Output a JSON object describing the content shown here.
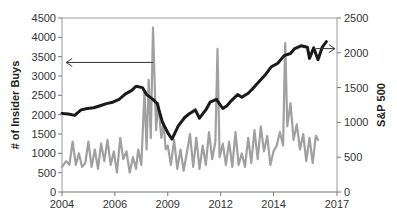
{
  "chart_data": {
    "type": "line",
    "title": "",
    "xlabel": "",
    "ylabel": "# of Insider Buys",
    "y2label": "S&P 500",
    "xlim": [
      2004,
      2017
    ],
    "ylim": [
      0,
      4500
    ],
    "y2lim": [
      0,
      2500
    ],
    "grid": false,
    "legend": "none",
    "x_ticks": [
      "2004",
      "2006",
      "2009",
      "2012",
      "2014",
      "2017"
    ],
    "x_tick_values": [
      2004,
      2006.5,
      2009,
      2011.5,
      2014,
      2016.5
    ],
    "y_ticks": [
      "0",
      "500",
      "1000",
      "1500",
      "2000",
      "2500",
      "3000",
      "3500",
      "4000",
      "4500"
    ],
    "y2_ticks": [
      "0",
      "500",
      "1000",
      "1500",
      "2000",
      "2500"
    ],
    "series": [
      {
        "name": "# of Insider Buys",
        "axis": "left",
        "color": "#a0a0a0",
        "x": [
          2004.0,
          2004.2,
          2004.35,
          2004.5,
          2004.65,
          2004.8,
          2004.95,
          2005.1,
          2005.25,
          2005.4,
          2005.55,
          2005.7,
          2005.85,
          2006.0,
          2006.15,
          2006.3,
          2006.45,
          2006.6,
          2006.75,
          2006.9,
          2007.05,
          2007.2,
          2007.35,
          2007.5,
          2007.6,
          2007.75,
          2007.9,
          2008.0,
          2008.1,
          2008.2,
          2008.3,
          2008.45,
          2008.55,
          2008.7,
          2008.8,
          2008.9,
          2009.0,
          2009.15,
          2009.3,
          2009.45,
          2009.6,
          2009.75,
          2009.9,
          2010.05,
          2010.2,
          2010.35,
          2010.5,
          2010.65,
          2010.8,
          2010.95,
          2011.1,
          2011.25,
          2011.35,
          2011.45,
          2011.6,
          2011.75,
          2011.9,
          2012.05,
          2012.2,
          2012.35,
          2012.5,
          2012.65,
          2012.8,
          2012.95,
          2013.1,
          2013.25,
          2013.4,
          2013.55,
          2013.7,
          2013.85,
          2014.0,
          2014.15,
          2014.3,
          2014.45,
          2014.55,
          2014.65,
          2014.8,
          2014.95,
          2015.1,
          2015.25,
          2015.4,
          2015.55,
          2015.7,
          2015.85,
          2016.0,
          2016.1
        ],
        "values": [
          650,
          800,
          700,
          1300,
          700,
          1000,
          650,
          750,
          1300,
          650,
          1100,
          600,
          1250,
          800,
          1350,
          700,
          1050,
          500,
          1400,
          850,
          1050,
          500,
          900,
          600,
          1100,
          700,
          2600,
          1100,
          2900,
          1400,
          4250,
          1600,
          2300,
          1400,
          1800,
          1100,
          1200,
          700,
          1350,
          600,
          1100,
          550,
          1000,
          1500,
          650,
          1400,
          600,
          1200,
          700,
          1550,
          850,
          1300,
          3700,
          900,
          1250,
          700,
          1300,
          650,
          1550,
          700,
          1000,
          650,
          1400,
          750,
          1600,
          850,
          1700,
          1050,
          1450,
          700,
          1050,
          1200,
          1550,
          1200,
          3850,
          1700,
          2300,
          1350,
          1750,
          1100,
          1500,
          800,
          1400,
          750,
          1450,
          1350
        ]
      },
      {
        "name": "S&P 500",
        "axis": "right",
        "color": "#1a1a1a",
        "x": [
          2004.0,
          2004.3,
          2004.6,
          2004.9,
          2005.2,
          2005.5,
          2005.8,
          2006.1,
          2006.4,
          2006.7,
          2007.0,
          2007.3,
          2007.5,
          2007.8,
          2008.0,
          2008.3,
          2008.5,
          2008.75,
          2009.0,
          2009.2,
          2009.5,
          2009.8,
          2010.0,
          2010.3,
          2010.5,
          2010.8,
          2011.0,
          2011.3,
          2011.6,
          2011.8,
          2012.0,
          2012.3,
          2012.5,
          2012.8,
          2013.0,
          2013.3,
          2013.6,
          2013.9,
          2014.2,
          2014.5,
          2014.8,
          2015.0,
          2015.3,
          2015.6,
          2015.7,
          2015.9,
          2016.1,
          2016.3,
          2016.5
        ],
        "values": [
          1130,
          1120,
          1100,
          1180,
          1200,
          1210,
          1240,
          1270,
          1290,
          1330,
          1410,
          1460,
          1520,
          1500,
          1400,
          1330,
          1270,
          1000,
          850,
          760,
          950,
          1070,
          1120,
          1180,
          1060,
          1180,
          1290,
          1330,
          1200,
          1240,
          1310,
          1400,
          1360,
          1420,
          1480,
          1580,
          1680,
          1800,
          1850,
          1960,
          1990,
          2060,
          2100,
          2080,
          1920,
          2070,
          1900,
          2080,
          2160
        ]
      }
    ],
    "annotations": [
      {
        "type": "arrow",
        "direction": "left",
        "axis_hint": "points to left axis (# of Insider Buys)",
        "from_x": 2008.3,
        "to_x": 2004.2,
        "y_left": 3350
      },
      {
        "type": "arrow",
        "direction": "right",
        "axis_hint": "points to right axis (S&P 500)",
        "from_x": 2016.0,
        "to_x": 2016.9,
        "y_right": 2060
      }
    ]
  },
  "axes": {
    "left_title": "# of Insider Buys",
    "right_title": "S&P 500"
  }
}
